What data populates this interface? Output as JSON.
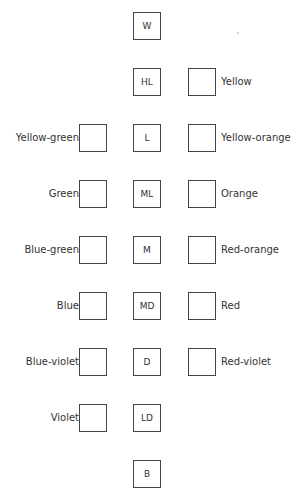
{
  "value_scale": [
    {
      "code": "W",
      "top": 12
    },
    {
      "code": "HL",
      "top": 68
    },
    {
      "code": "L",
      "top": 124
    },
    {
      "code": "ML",
      "top": 180
    },
    {
      "code": "M",
      "top": 236
    },
    {
      "code": "MD",
      "top": 292
    },
    {
      "code": "D",
      "top": 348
    },
    {
      "code": "LD",
      "top": 404
    },
    {
      "code": "B",
      "top": 460
    }
  ],
  "right_hues": [
    {
      "label": "Yellow",
      "top": 68
    },
    {
      "label": "Yellow-orange",
      "top": 124
    },
    {
      "label": "Orange",
      "top": 180
    },
    {
      "label": "Red-orange",
      "top": 236
    },
    {
      "label": "Red",
      "top": 292
    },
    {
      "label": "Red-violet",
      "top": 348
    }
  ],
  "left_hues": [
    {
      "label": "Yellow-green",
      "top": 124
    },
    {
      "label": "Green",
      "top": 180
    },
    {
      "label": "Blue-green",
      "top": 236
    },
    {
      "label": "Blue",
      "top": 292
    },
    {
      "label": "Blue-violet",
      "top": 348
    },
    {
      "label": "Violet",
      "top": 404
    }
  ]
}
